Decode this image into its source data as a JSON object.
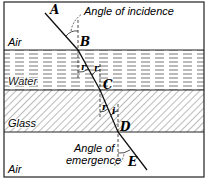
{
  "diagram": {
    "type": "refraction-through-layers",
    "media": [
      {
        "name": "air_top",
        "label": "Air"
      },
      {
        "name": "water",
        "label": "Water"
      },
      {
        "name": "glass",
        "label": "Glass"
      },
      {
        "name": "air_bottom",
        "label": "Air"
      }
    ],
    "points": {
      "A": "A",
      "B": "B",
      "C": "C",
      "D": "D",
      "E": "E"
    },
    "angle_labels": {
      "incidence": "Angle of incidence",
      "emergence_line1": "Angle of",
      "emergence_line2": "emergence",
      "r_left": "r",
      "r_right": "r",
      "glass_left": "r",
      "glass_right": "i"
    },
    "colors": {
      "line": "#111111",
      "background": "#ffffff",
      "hatch": "#555555",
      "water_dash": "#666666"
    }
  }
}
